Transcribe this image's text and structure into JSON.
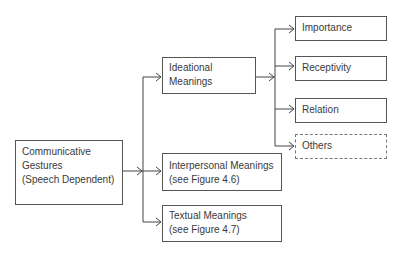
{
  "diagram": {
    "type": "tree",
    "root": {
      "id": "communicative",
      "lines": [
        "Communicative",
        "Gestures",
        "(Speech Dependent)"
      ]
    },
    "level1": [
      {
        "id": "ideational",
        "lines": [
          "Ideational",
          "Meanings"
        ]
      },
      {
        "id": "interpersonal",
        "lines": [
          "Interpersonal Meanings",
          "(see Figure 4.6)"
        ]
      },
      {
        "id": "textual",
        "lines": [
          "Textual Meanings",
          "(see Figure 4.7)"
        ]
      }
    ],
    "level2": [
      {
        "id": "importance",
        "label": "Importance",
        "style": "solid"
      },
      {
        "id": "receptivity",
        "label": "Receptivity",
        "style": "solid"
      },
      {
        "id": "relation",
        "label": "Relation",
        "style": "solid"
      },
      {
        "id": "others",
        "label": "Others",
        "style": "dashed"
      }
    ],
    "edges": [
      [
        "communicative",
        "ideational"
      ],
      [
        "communicative",
        "interpersonal"
      ],
      [
        "communicative",
        "textual"
      ],
      [
        "ideational",
        "importance"
      ],
      [
        "ideational",
        "receptivity"
      ],
      [
        "ideational",
        "relation"
      ],
      [
        "ideational",
        "others"
      ]
    ],
    "colors": {
      "line": "#444444",
      "border": "#555555",
      "text": "#3a3a3a"
    }
  }
}
